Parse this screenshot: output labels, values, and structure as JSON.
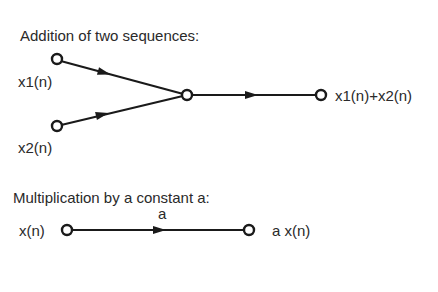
{
  "addition": {
    "title": "Addition of two sequences:",
    "input1": "x1(n)",
    "input2": "x2(n)",
    "output": "x1(n)+x2(n)"
  },
  "multiplication": {
    "title": "Multiplication by a constant a:",
    "input": "x(n)",
    "gain": "a",
    "output": "a x(n)"
  },
  "colors": {
    "stroke": "#1a1a1a",
    "text": "#2a2a2a",
    "background": "#ffffff"
  }
}
